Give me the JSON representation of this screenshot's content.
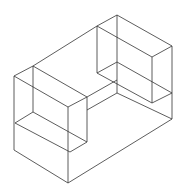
{
  "diagram": {
    "stroke_color": "#333333",
    "background": "#ffffff",
    "lines": [
      [
        117,
        15,
        172,
        46
      ],
      [
        117,
        15,
        97,
        26
      ],
      [
        97,
        26,
        33,
        66
      ],
      [
        33,
        66,
        14,
        76
      ],
      [
        14,
        76,
        68,
        107
      ],
      [
        33,
        66,
        87,
        97
      ],
      [
        68,
        107,
        87,
        97
      ],
      [
        14,
        76,
        14,
        150
      ],
      [
        33,
        66,
        33,
        112
      ],
      [
        68,
        107,
        68,
        183
      ],
      [
        87,
        97,
        87,
        142
      ],
      [
        14,
        150,
        68,
        183
      ],
      [
        68,
        183,
        172,
        119
      ],
      [
        172,
        46,
        172,
        119
      ],
      [
        117,
        15,
        117,
        80
      ],
      [
        97,
        26,
        97,
        73
      ],
      [
        97,
        26,
        152,
        57
      ],
      [
        152,
        57,
        172,
        46
      ],
      [
        152,
        57,
        152,
        103
      ],
      [
        97,
        73,
        117,
        62
      ],
      [
        117,
        62,
        172,
        93
      ],
      [
        97,
        73,
        152,
        103
      ],
      [
        152,
        103,
        172,
        93
      ],
      [
        87,
        97,
        117,
        80
      ],
      [
        87,
        110,
        117,
        93
      ],
      [
        117,
        80,
        117,
        93
      ],
      [
        117,
        93,
        172,
        119
      ],
      [
        15,
        123,
        33,
        112
      ],
      [
        15,
        123,
        70,
        152
      ],
      [
        33,
        112,
        87,
        142
      ],
      [
        70,
        152,
        87,
        142
      ]
    ]
  }
}
